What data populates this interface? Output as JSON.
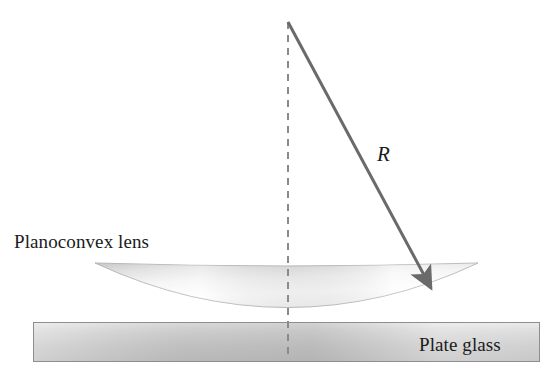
{
  "figure": {
    "background_color": "#ffffff",
    "width": 546,
    "height": 377
  },
  "labels": {
    "lens": "Planoconvex lens",
    "plate": "Plate glass",
    "radius": "R"
  },
  "colors": {
    "lens_fill_light": "#fdfdfd",
    "lens_fill_mid": "#e2e2e2",
    "lens_fill_dark": "#c9c9c9",
    "lens_outline": "#b5b5b5",
    "plate_fill_light": "#e9e9e9",
    "plate_fill_mid": "#cfcfcf",
    "plate_fill_dark": "#b4b4b4",
    "plate_outline": "#8e8e8e",
    "arrow_stroke": "#6a6a6a",
    "dashed_stroke": "#8a8a8a",
    "text": "#1b1b1b"
  },
  "geometry": {
    "center_x": 288,
    "dashed_line": {
      "x": 288,
      "y_top": 22,
      "y_bottom": 360,
      "dash": "7 6",
      "width": 2
    },
    "radius_arrow": {
      "x1": 288,
      "y1": 22,
      "x2": 434,
      "y2": 291,
      "width": 3,
      "head_length": 17,
      "head_width": 11
    },
    "lens": {
      "left_x": 95,
      "right_x": 478,
      "top_y": 263,
      "bottom_y": 324,
      "top_sag": 6
    },
    "plate": {
      "left_x": 33,
      "right_x": 540,
      "top_y": 322,
      "bottom_y": 362
    }
  }
}
